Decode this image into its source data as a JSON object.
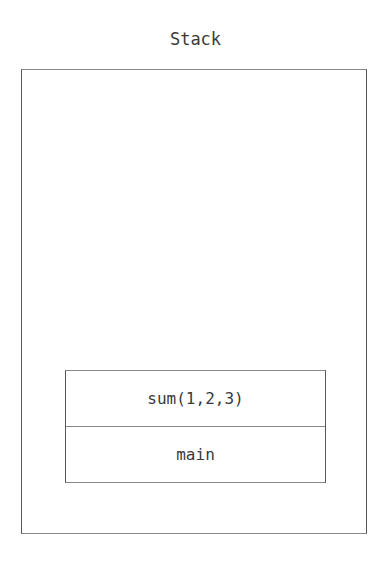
{
  "diagram": {
    "title": "Stack",
    "frames": [
      {
        "label": "sum(1,2,3)"
      },
      {
        "label": "main"
      }
    ]
  }
}
